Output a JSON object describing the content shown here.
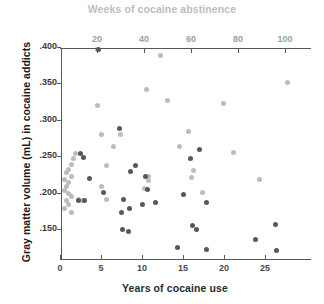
{
  "chart_data": {
    "type": "scatter",
    "title": "",
    "top_title": "Weeks of cocaine abstinence",
    "xlabel": "Years of cocaine use",
    "ylabel": "Gray matter volume (mL) in cocaine addicts",
    "grid": false,
    "legend": "none",
    "xlim": [
      0,
      32
    ],
    "ylim": [
      0.115,
      0.4
    ],
    "x2lim": [
      0,
      116
    ],
    "xticks": [
      0,
      5,
      10,
      15,
      20,
      25
    ],
    "xtick_labels": [
      "0",
      "5",
      "10",
      "15",
      "20",
      "25"
    ],
    "x2ticks": [
      20,
      40,
      60,
      80,
      100
    ],
    "x2tick_labels": [
      "20",
      "40",
      "60",
      "80",
      "100"
    ],
    "yticks": [
      0.4,
      0.35,
      0.3,
      0.25,
      0.2,
      0.15
    ],
    "ytick_labels": [
      ".400",
      ".350",
      ".300",
      ".250",
      ".200",
      ".150"
    ],
    "colors": {
      "abstinence_series": "#bcbcbc",
      "years_series": "#585858",
      "top_axis_text": "#bdbdbd",
      "bottom_axis_text": "#2b2b2b",
      "axis_line": "#55595c"
    },
    "series": [
      {
        "name": "Weeks of cocaine abstinence",
        "axis": "top",
        "color": "#bcbcbc",
        "marker": "circle",
        "points": [
          [
            20,
            0.396
          ],
          [
            47,
            0.389
          ],
          [
            41,
            0.342
          ],
          [
            50,
            0.327
          ],
          [
            20,
            0.32
          ],
          [
            74,
            0.322
          ],
          [
            101,
            0.351
          ],
          [
            22,
            0.28
          ],
          [
            30,
            0.28
          ],
          [
            27,
            0.263
          ],
          [
            55,
            0.263
          ],
          [
            59,
            0.284
          ],
          [
            78,
            0.255
          ],
          [
            11,
            0.254
          ],
          [
            10,
            0.247
          ],
          [
            9,
            0.238
          ],
          [
            8,
            0.232
          ],
          [
            7,
            0.227
          ],
          [
            9,
            0.222
          ],
          [
            6,
            0.218
          ],
          [
            8,
            0.214
          ],
          [
            7,
            0.208
          ],
          [
            6,
            0.203
          ],
          [
            8,
            0.199
          ],
          [
            9,
            0.194
          ],
          [
            7,
            0.189
          ],
          [
            8,
            0.184
          ],
          [
            6,
            0.178
          ],
          [
            9,
            0.173
          ],
          [
            24,
            0.237
          ],
          [
            22,
            0.208
          ],
          [
            24,
            0.191
          ],
          [
            42,
            0.222
          ],
          [
            42,
            0.216
          ],
          [
            40,
            0.206
          ],
          [
            61,
            0.23
          ],
          [
            60,
            0.221
          ],
          [
            65,
            0.2
          ],
          [
            89,
            0.218
          ],
          [
            14,
            0.189
          ],
          [
            12,
            0.19
          ]
        ]
      },
      {
        "name": "Years of cocaine use",
        "axis": "bottom",
        "color": "#585858",
        "marker": "circle",
        "points": [
          [
            4.7,
            0.396
          ],
          [
            7.3,
            0.288
          ],
          [
            17.0,
            0.259
          ],
          [
            15.9,
            0.247
          ],
          [
            2.9,
            0.248
          ],
          [
            2.5,
            0.254
          ],
          [
            3.6,
            0.219
          ],
          [
            9.2,
            0.237
          ],
          [
            8.6,
            0.229
          ],
          [
            10.4,
            0.222
          ],
          [
            15.0,
            0.198
          ],
          [
            5.3,
            0.2
          ],
          [
            10.7,
            0.204
          ],
          [
            11.6,
            0.186
          ],
          [
            17.9,
            0.187
          ],
          [
            2.3,
            0.189
          ],
          [
            3.0,
            0.189
          ],
          [
            7.7,
            0.19
          ],
          [
            8.5,
            0.178
          ],
          [
            10.1,
            0.183
          ],
          [
            7.5,
            0.172
          ],
          [
            7.6,
            0.149
          ],
          [
            8.4,
            0.146
          ],
          [
            16.1,
            0.155
          ],
          [
            16.6,
            0.15
          ],
          [
            26.3,
            0.156
          ],
          [
            23.8,
            0.135
          ],
          [
            14.3,
            0.124
          ],
          [
            17.9,
            0.122
          ],
          [
            26.4,
            0.12
          ]
        ]
      }
    ]
  },
  "axes": {
    "left_tick_labels": [
      ".400",
      ".350",
      ".300",
      ".250",
      ".200",
      ".150"
    ],
    "bottom_tick_labels": [
      "0",
      "5",
      "10",
      "15",
      "20",
      "25"
    ],
    "top_tick_labels": [
      "20",
      "40",
      "60",
      "80",
      "100"
    ]
  }
}
